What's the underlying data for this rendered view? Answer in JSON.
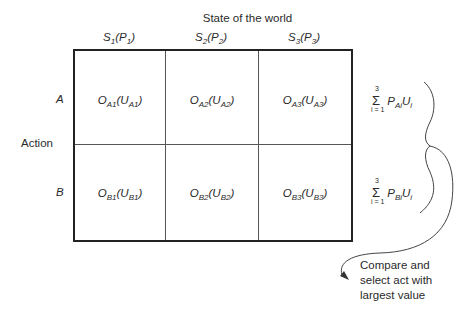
{
  "diagram": {
    "title": "State of the world",
    "states": [
      {
        "symbol": "S",
        "index": "1",
        "prob_symbol": "P",
        "prob_index": "1"
      },
      {
        "symbol": "S",
        "index": "2",
        "prob_symbol": "P",
        "prob_index": "2"
      },
      {
        "symbol": "S",
        "index": "3",
        "prob_symbol": "P",
        "prob_index": "3"
      }
    ],
    "action_label": "Action",
    "actions": [
      {
        "label": "A",
        "outcomes": [
          {
            "o": "O",
            "o_sub": "A1",
            "u": "U",
            "u_sub": "A1"
          },
          {
            "o": "O",
            "o_sub": "A2",
            "u": "U",
            "u_sub": "A2"
          },
          {
            "o": "O",
            "o_sub": "A3",
            "u": "U",
            "u_sub": "A3"
          }
        ],
        "expected_value": {
          "sigma": "Σ",
          "upper": "3",
          "lower": "i = 1",
          "p": "P",
          "p_sub": "Ai",
          "u": "U",
          "u_sub": "i"
        }
      },
      {
        "label": "B",
        "outcomes": [
          {
            "o": "O",
            "o_sub": "B1",
            "u": "U",
            "u_sub": "B1"
          },
          {
            "o": "O",
            "o_sub": "B2",
            "u": "U",
            "u_sub": "B2"
          },
          {
            "o": "O",
            "o_sub": "B3",
            "u": "U",
            "u_sub": "B3"
          }
        ],
        "expected_value": {
          "sigma": "Σ",
          "upper": "3",
          "lower": "i = 1",
          "p": "P",
          "p_sub": "Bi",
          "u": "U",
          "u_sub": "i"
        }
      }
    ],
    "note_lines": [
      "Compare and",
      "select act with",
      "largest value"
    ],
    "colors": {
      "line": "#222222",
      "text": "#2a2a2a"
    }
  }
}
